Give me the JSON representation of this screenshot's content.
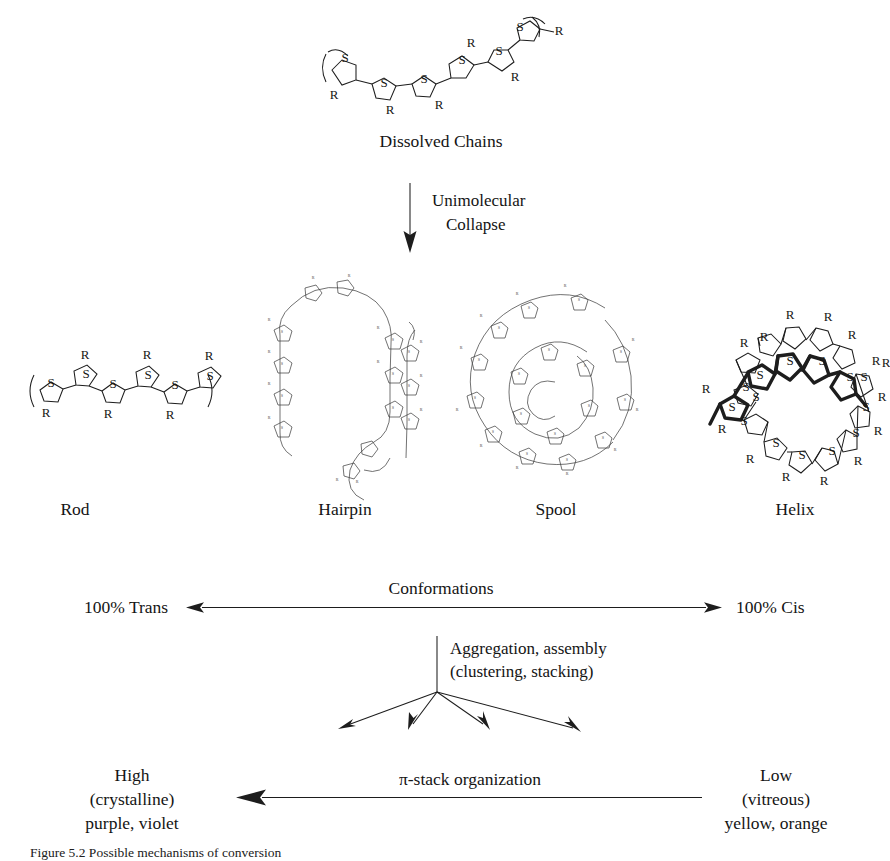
{
  "figure": {
    "domain": "scientific-diagram",
    "caption": "Figure 5.2  Possible mechanisms of conversion"
  },
  "top": {
    "structure_name": "dissolved-chain-structure",
    "label": "Dissolved Chains",
    "atom_s": "S",
    "atom_r": "R"
  },
  "collapse": {
    "arrow_name": "unimolecular-collapse-arrow",
    "line1": "Unimolecular",
    "line2": "Collapse"
  },
  "conformations": [
    {
      "key": "rod",
      "label": "Rod",
      "cx": 75
    },
    {
      "key": "hairpin",
      "label": "Hairpin",
      "cx": 345
    },
    {
      "key": "spool",
      "label": "Spool",
      "cx": 556
    },
    {
      "key": "helix",
      "label": "Helix",
      "cx": 795
    }
  ],
  "conformation_axis": {
    "name": "conformations-axis",
    "title": "Conformations",
    "left_label": "100% Trans",
    "right_label": "100% Cis",
    "left_x": 193,
    "right_x": 712,
    "y": 607
  },
  "aggregation": {
    "name": "aggregation-fan",
    "line1": "Aggregation, assembly",
    "line2": "(clustering, stacking)",
    "origin_x": 437,
    "origin_y": 692,
    "tips": [
      {
        "x": 338,
        "y": 729
      },
      {
        "x": 409,
        "y": 726
      },
      {
        "x": 486,
        "y": 728
      },
      {
        "x": 580,
        "y": 732
      }
    ]
  },
  "stack_axis": {
    "name": "pi-stack-axis",
    "title": "π-stack organization",
    "left": {
      "line1": "High",
      "line2": "(crystalline)",
      "line3": "purple, violet"
    },
    "right": {
      "line1": "Low",
      "line2": "(vitreous)",
      "line3": "yellow, orange"
    },
    "arrow_tip_x": 242,
    "arrow_tail_x": 700,
    "y": 797
  },
  "colors": {
    "ink": "#1d1d1d",
    "faint_ink": "#3a3a3a",
    "background": "#ffffff"
  }
}
